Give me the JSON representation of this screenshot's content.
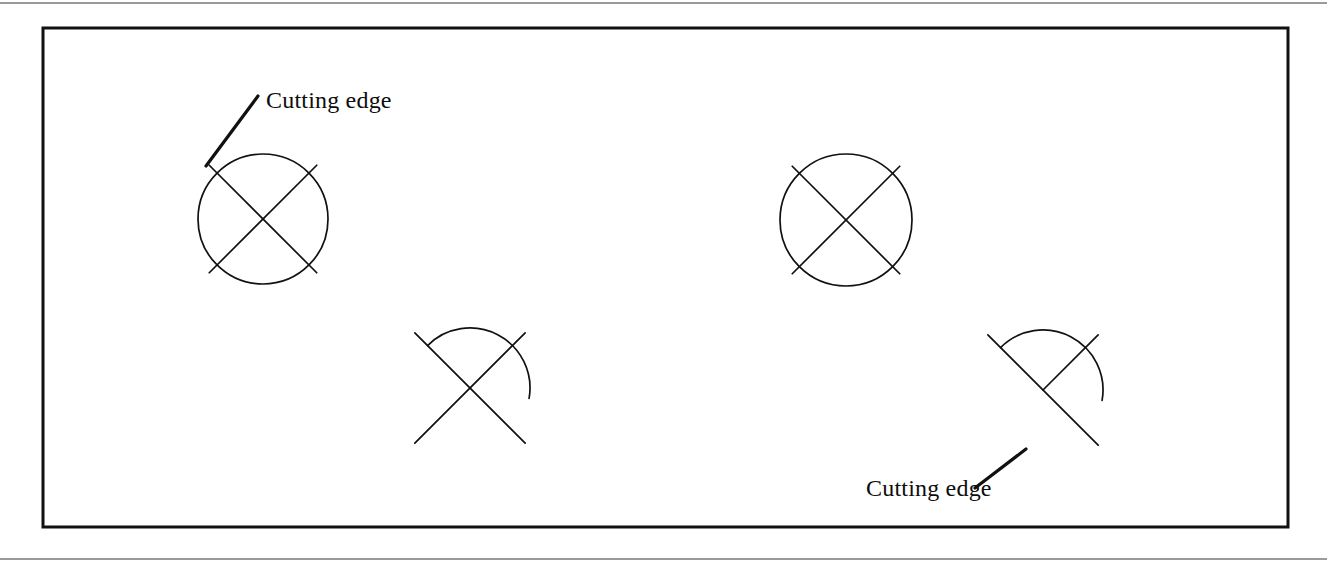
{
  "page": {
    "width": 1327,
    "height": 570,
    "background_color": "#ffffff",
    "ink_color": "#111111",
    "rule_color": "#9a9a9a"
  },
  "frame": {
    "name": "figure-border",
    "x": 43,
    "y": 28,
    "width": 1245,
    "height": 499,
    "stroke_width": 3,
    "color": "#111111"
  },
  "labels": {
    "top_left": "Cutting edge",
    "bottom_right": "Cutting edge"
  },
  "figures": [
    {
      "id": "fig-top-left",
      "type": "full-circle-with-x",
      "center_x": 263,
      "center_y": 219,
      "radius": 65,
      "cross_half_length": 76,
      "has_label": true,
      "label": "Cutting edge",
      "label_x": 266,
      "label_y": 108,
      "leader_from_x": 258,
      "leader_from_y": 96,
      "leader_to_x": 206,
      "leader_to_y": 166
    },
    {
      "id": "fig-top-right",
      "type": "full-circle-with-x",
      "center_x": 846,
      "center_y": 220,
      "radius": 66,
      "cross_half_length": 76,
      "has_label": false,
      "label": ""
    },
    {
      "id": "fig-bottom-left",
      "type": "arc-with-x",
      "center_x": 470,
      "center_y": 388,
      "radius": 60,
      "arc_start_deg": 135,
      "arc_end_deg": 350,
      "cross_half_length": 78,
      "second_line_truncated": false,
      "has_label": false,
      "label": ""
    },
    {
      "id": "fig-bottom-right",
      "type": "arc-with-x",
      "center_x": 1043,
      "center_y": 390,
      "radius": 60,
      "arc_start_deg": 135,
      "arc_end_deg": 350,
      "cross_half_length": 78,
      "second_line_truncated": true,
      "has_label": true,
      "label": "Cutting edge",
      "label_x": 866,
      "label_y": 496,
      "leader_from_x": 975,
      "leader_from_y": 488,
      "leader_to_x": 1026,
      "leader_to_y": 449
    }
  ]
}
